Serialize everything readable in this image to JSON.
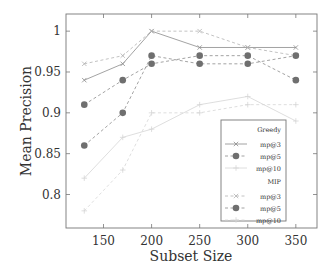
{
  "chart_data": {
    "type": "line",
    "title": "",
    "xlabel": "Subset Size",
    "ylabel": "Mean Precision",
    "x": [
      130,
      170,
      200,
      250,
      300,
      350
    ],
    "xticks": [
      150,
      200,
      250,
      300,
      350
    ],
    "xtick_labels": [
      "150",
      "200",
      "250",
      "300",
      "350"
    ],
    "yticks": [
      0.8,
      0.85,
      0.9,
      0.95,
      1.0
    ],
    "ytick_labels": [
      "0.8",
      "0.85",
      "0.9",
      "0.95",
      "1"
    ],
    "xlim": [
      111,
      372
    ],
    "ylim": [
      0.759,
      1.021
    ],
    "grid": false,
    "legend_position": "lower right (inside)",
    "legend_groups": [
      "Greedy",
      "MIP"
    ],
    "series": [
      {
        "group": "Greedy",
        "name": "mp@3",
        "marker": "x",
        "dash": "solid",
        "color": "#8c8c8c",
        "values": [
          0.94,
          0.96,
          1.0,
          0.98,
          0.98,
          0.98
        ]
      },
      {
        "group": "Greedy",
        "name": "mp@5",
        "marker": "o",
        "dash": "dashed",
        "color": "#8c8c8c",
        "values": [
          0.91,
          0.94,
          0.96,
          0.97,
          0.97,
          0.94
        ]
      },
      {
        "group": "Greedy",
        "name": "mp@10",
        "marker": "+",
        "dash": "solid",
        "color": "#d6d6d6",
        "values": [
          0.82,
          0.87,
          0.88,
          0.91,
          0.92,
          0.89
        ]
      },
      {
        "group": "MIP",
        "name": "mp@3",
        "marker": "x",
        "dash": "dashed",
        "color": "#b3b3b3",
        "values": [
          0.96,
          0.97,
          1.0,
          1.0,
          0.98,
          0.97
        ]
      },
      {
        "group": "MIP",
        "name": "mp@5",
        "marker": "o",
        "dash": "dashed",
        "color": "#8c8c8c",
        "values": [
          0.86,
          0.9,
          0.97,
          0.96,
          0.96,
          0.97
        ]
      },
      {
        "group": "MIP",
        "name": "mp@10",
        "marker": "+",
        "dash": "dashed",
        "color": "#d6d6d6",
        "values": [
          0.78,
          0.83,
          0.9,
          0.9,
          0.91,
          0.91
        ]
      }
    ]
  }
}
